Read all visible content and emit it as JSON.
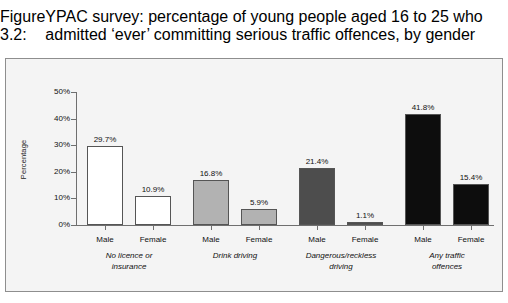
{
  "figure": {
    "number": "Figure 3.2:",
    "caption": "YPAC survey: percentage of young people aged 16 to 25 who admitted ‘ever’ committing serious traffic offences, by gender"
  },
  "chart_data": {
    "type": "bar",
    "title": "YPAC survey: percentage of young people aged 16 to 25 who admitted ‘ever’ committing serious traffic offences, by gender",
    "xlabel": "",
    "ylabel": "Percentage",
    "ylim": [
      0,
      50
    ],
    "ytick_labels": [
      "0%",
      "10%",
      "20%",
      "30%",
      "40%",
      "50%"
    ],
    "ytick_values": [
      0,
      10,
      20,
      30,
      40,
      50
    ],
    "grid": false,
    "legend": "none",
    "groups": [
      {
        "name": "No licence or insurance",
        "label_lines": [
          "No licence or",
          "insurance"
        ],
        "color": "#ffffff",
        "bars": [
          {
            "category": "Male",
            "value": 29.7,
            "label": "29.7%"
          },
          {
            "category": "Female",
            "value": 10.9,
            "label": "10.9%"
          }
        ]
      },
      {
        "name": "Drink driving",
        "label_lines": [
          "Drink driving"
        ],
        "color": "#b2b2b2",
        "bars": [
          {
            "category": "Male",
            "value": 16.8,
            "label": "16.8%"
          },
          {
            "category": "Female",
            "value": 5.9,
            "label": "5.9%"
          }
        ]
      },
      {
        "name": "Dangerous/reckless driving",
        "label_lines": [
          "Dangerous/reckless",
          "driving"
        ],
        "color": "#4d4d4d",
        "bars": [
          {
            "category": "Male",
            "value": 21.4,
            "label": "21.4%"
          },
          {
            "category": "Female",
            "value": 1.1,
            "label": "1.1%"
          }
        ]
      },
      {
        "name": "Any traffic offences",
        "label_lines": [
          "Any traffic",
          "offences"
        ],
        "color": "#0d0d0d",
        "bars": [
          {
            "category": "Male",
            "value": 41.8,
            "label": "41.8%"
          },
          {
            "category": "Female",
            "value": 15.4,
            "label": "15.4%"
          }
        ]
      }
    ],
    "categories": [
      "Male",
      "Female",
      "Male",
      "Female",
      "Male",
      "Female",
      "Male",
      "Female"
    ],
    "values": [
      29.7,
      10.9,
      16.8,
      5.9,
      21.4,
      1.1,
      41.8,
      15.4
    ]
  },
  "colors": {
    "panel_background": "#f4f4f4",
    "panel_border": "#8e8e8e",
    "axis": "#6f6f6f",
    "text": "#111111"
  }
}
